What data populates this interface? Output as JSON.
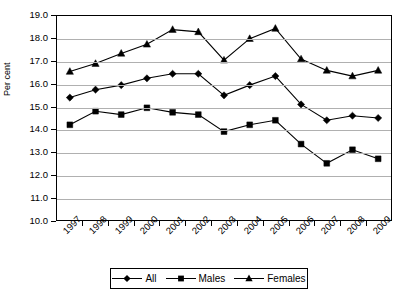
{
  "chart_data": {
    "type": "line",
    "title": "",
    "subtitle": "",
    "xlabel": "",
    "ylabel": "Per cent",
    "categories": [
      "1997",
      "1998",
      "1999",
      "2000",
      "2001",
      "2002",
      "2003",
      "2004",
      "2005",
      "2006",
      "2007",
      "2008",
      "2009"
    ],
    "ylim": [
      10.0,
      19.0
    ],
    "ytick_step": 1.0,
    "ytick_labels": [
      "19.0",
      "18.0",
      "17.0",
      "16.0",
      "15.0",
      "14.0",
      "13.0",
      "12.0",
      "11.0",
      "10.0"
    ],
    "grid": "horizontal",
    "legend_position": "bottom",
    "series": [
      {
        "name": "All",
        "marker": "diamond",
        "color": "#000000",
        "values": [
          15.4,
          15.75,
          15.95,
          16.25,
          16.45,
          16.45,
          15.5,
          15.95,
          16.35,
          15.1,
          14.4,
          14.6,
          14.5
        ]
      },
      {
        "name": "Males",
        "marker": "square",
        "color": "#000000",
        "values": [
          14.2,
          14.8,
          14.65,
          14.95,
          14.75,
          14.65,
          13.9,
          14.2,
          14.4,
          13.35,
          12.5,
          13.1,
          12.7
        ]
      },
      {
        "name": "Females",
        "marker": "triangle",
        "color": "#000000",
        "values": [
          16.55,
          16.9,
          17.35,
          17.75,
          18.4,
          18.3,
          17.05,
          18.0,
          18.45,
          17.1,
          16.6,
          16.35,
          16.6
        ]
      }
    ]
  },
  "legend": {
    "entries": [
      {
        "label": "All",
        "marker": "diamond-icon"
      },
      {
        "label": "Males",
        "marker": "square-icon"
      },
      {
        "label": "Females",
        "marker": "triangle-icon"
      }
    ]
  }
}
